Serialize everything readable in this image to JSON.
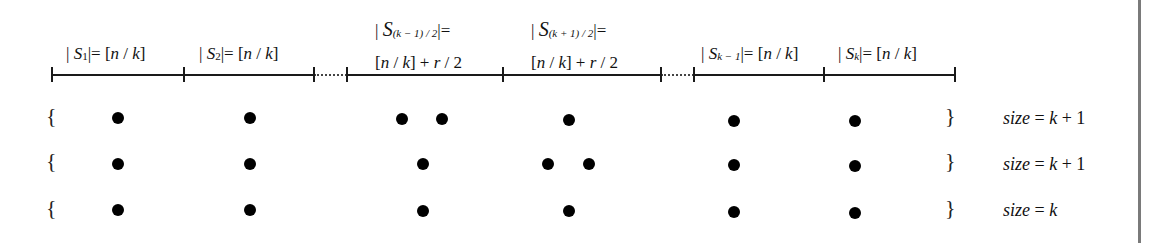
{
  "diagram": {
    "segments": [
      {
        "name": "S1",
        "line1": "",
        "prefix": "| ",
        "sym": "S",
        "sub": "1",
        "suffix": "|= [n / k]"
      },
      {
        "name": "S2",
        "line1": "",
        "prefix": "| ",
        "sym": "S",
        "sub": "2",
        "suffix": "|= [n / k]"
      },
      {
        "name": "S(k-1)/2",
        "prefix": "| ",
        "sym": "S",
        "sub": "(k − 1) / 2",
        "suffix": "|=",
        "line2": "[n / k] + r / 2"
      },
      {
        "name": "S(k+1)/2",
        "prefix": "| ",
        "sym": "S",
        "sub": "(k + 1) / 2",
        "suffix": "|=",
        "line2": "[n / k] + r / 2"
      },
      {
        "name": "Sk-1",
        "prefix": "| ",
        "sym": "S",
        "sub": "k − 1",
        "suffix": "|= [n / k]"
      },
      {
        "name": "Sk",
        "prefix": "| ",
        "sym": "S",
        "sub": "k",
        "suffix": "|= [n / k]"
      }
    ],
    "ticks_x": [
      52,
      184,
      314,
      347,
      503,
      661,
      694,
      824,
      955
    ],
    "rows": [
      {
        "open": "{",
        "close": "}",
        "size_label": "size = k + 1",
        "dots_x": [
          118,
          250,
          402,
          442,
          582,
          758,
          887
        ]
      },
      {
        "open": "{",
        "close": "}",
        "size_label": "size = k + 1",
        "dots_x": [
          118,
          250,
          426,
          561,
          604,
          758,
          887
        ]
      },
      {
        "open": "{",
        "close": "}",
        "size_label": "size = k",
        "dots_x": [
          118,
          250,
          426,
          582,
          758,
          887
        ]
      }
    ],
    "labels": {
      "s1": {
        "pre": "| ",
        "s": "S",
        "sub": "1",
        "post": "|= [",
        "n": "n",
        "slash": " / ",
        "k": "k",
        "end": "]"
      },
      "s2": {
        "pre": "| ",
        "s": "S",
        "sub": "2",
        "post": "|= [",
        "n": "n",
        "slash": " / ",
        "k": "k",
        "end": "]"
      },
      "s_mid1": {
        "pre": "| ",
        "s": "S",
        "sub": "(k − 1) / 2",
        "post": "|=",
        "l2a": "[",
        "n": "n",
        "slash": " / ",
        "k": "k",
        "l2b": "] + ",
        "r": "r",
        "l2c": " / 2"
      },
      "s_mid2": {
        "pre": "| ",
        "s": "S",
        "sub": "(k + 1) / 2",
        "post": "|=",
        "l2a": "[",
        "n": "n",
        "slash": " / ",
        "k": "k",
        "l2b": "] + ",
        "r": "r",
        "l2c": " / 2"
      },
      "s_km1": {
        "pre": "| ",
        "s": "S",
        "sub": "k − 1",
        "post": "|= [",
        "n": "n",
        "slash": " / ",
        "k": "k",
        "end": "]"
      },
      "s_k": {
        "pre": "| ",
        "s": "S",
        "sub": "k",
        "post": "|= [",
        "n": "n",
        "slash": " / ",
        "k": "k",
        "end": "]"
      }
    },
    "size_labels": {
      "row1": {
        "word": "size",
        "eq": " = ",
        "var": "k",
        "rest": " + 1"
      },
      "row2": {
        "word": "size",
        "eq": " = ",
        "var": "k",
        "rest": " + 1"
      },
      "row3": {
        "word": "size",
        "eq": " = ",
        "var": "k",
        "rest": ""
      }
    },
    "braces": {
      "open": "{",
      "close": "}"
    },
    "colors": {
      "ink": "#111111",
      "border": "#7a7a7a",
      "background": "#ffffff"
    }
  }
}
